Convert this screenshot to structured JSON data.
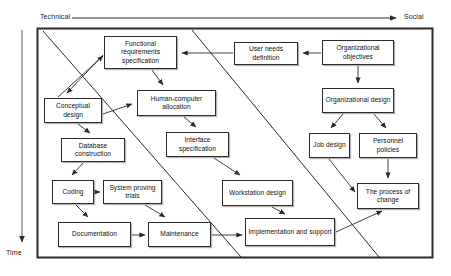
{
  "diagram": {
    "axes": {
      "horizontal": {
        "start_label": "Technical",
        "end_label": "Social",
        "direction": "left-to-right"
      },
      "vertical": {
        "label": "Time",
        "direction": "top-to-bottom"
      }
    },
    "frame": {
      "x": 37,
      "y": 28,
      "width": 396,
      "height": 230
    },
    "colors": {
      "line": "#2b2b2b",
      "box_fill": "#ffffff",
      "text": "#111111",
      "shadow": "#787878",
      "background": "#ffffff"
    },
    "nodes": [
      {
        "id": "functional-requirements-specification",
        "label": "Functional requirements specification",
        "x": 104,
        "y": 36,
        "w": 73,
        "h": 33
      },
      {
        "id": "user-needs-definition",
        "label": "User needs definition",
        "x": 234,
        "y": 42,
        "w": 64,
        "h": 23
      },
      {
        "id": "organizational-objectives",
        "label": "Organizational objectives",
        "x": 322,
        "y": 40,
        "w": 72,
        "h": 25
      },
      {
        "id": "conceptual-design",
        "label": "Conceptual design",
        "x": 44,
        "y": 98,
        "w": 58,
        "h": 25
      },
      {
        "id": "human-computer-allocation",
        "label": "Human-computer allocation",
        "x": 137,
        "y": 90,
        "w": 79,
        "h": 26
      },
      {
        "id": "organizational-design",
        "label": "Organizational design",
        "x": 322,
        "y": 88,
        "w": 72,
        "h": 25
      },
      {
        "id": "database-construction",
        "label": "Database construction",
        "x": 61,
        "y": 138,
        "w": 64,
        "h": 24
      },
      {
        "id": "interface-specification",
        "label": "Interface specification",
        "x": 166,
        "y": 132,
        "w": 63,
        "h": 25
      },
      {
        "id": "job-design",
        "label": "Job design",
        "x": 309,
        "y": 133,
        "w": 41,
        "h": 25
      },
      {
        "id": "personnel-policies",
        "label": "Personnel policies",
        "x": 359,
        "y": 133,
        "w": 58,
        "h": 25
      },
      {
        "id": "coding",
        "label": "Coding",
        "x": 52,
        "y": 180,
        "w": 42,
        "h": 24
      },
      {
        "id": "system-proving-trials",
        "label": "System proving trials",
        "x": 103,
        "y": 180,
        "w": 59,
        "h": 24
      },
      {
        "id": "workstation-design",
        "label": "Workstation design",
        "x": 222,
        "y": 180,
        "w": 71,
        "h": 26
      },
      {
        "id": "the-process-of-change",
        "label": "The process of change",
        "x": 357,
        "y": 183,
        "w": 62,
        "h": 26
      },
      {
        "id": "documentation",
        "label": "Documentation",
        "x": 58,
        "y": 222,
        "w": 73,
        "h": 25
      },
      {
        "id": "maintenance",
        "label": "Maintenance",
        "x": 148,
        "y": 222,
        "w": 63,
        "h": 25
      },
      {
        "id": "implementation-and-support",
        "label": "Implementation and support",
        "x": 245,
        "y": 218,
        "w": 90,
        "h": 28
      }
    ],
    "edges": [
      {
        "from": "organizational-objectives",
        "to": "user-needs-definition"
      },
      {
        "from": "user-needs-definition",
        "to": "functional-requirements-specification"
      },
      {
        "from": "organizational-objectives",
        "to": "organizational-design"
      },
      {
        "from": "organizational-design",
        "to": "job-design"
      },
      {
        "from": "organizational-design",
        "to": "personnel-policies"
      },
      {
        "from": "functional-requirements-specification",
        "to": "conceptual-design"
      },
      {
        "from": "functional-requirements-specification",
        "to": "human-computer-allocation"
      },
      {
        "from": "conceptual-design",
        "to": "functional-requirements-specification"
      },
      {
        "from": "conceptual-design",
        "to": "human-computer-allocation"
      },
      {
        "from": "conceptual-design",
        "to": "database-construction"
      },
      {
        "from": "human-computer-allocation",
        "to": "interface-specification"
      },
      {
        "from": "database-construction",
        "to": "coding"
      },
      {
        "from": "coding",
        "to": "system-proving-trials"
      },
      {
        "from": "coding",
        "to": "documentation"
      },
      {
        "from": "system-proving-trials",
        "to": "maintenance"
      },
      {
        "from": "interface-specification",
        "to": "workstation-design"
      },
      {
        "from": "documentation",
        "to": "maintenance"
      },
      {
        "from": "maintenance",
        "to": "implementation-and-support"
      },
      {
        "from": "workstation-design",
        "to": "implementation-and-support"
      },
      {
        "from": "job-design",
        "to": "the-process-of-change"
      },
      {
        "from": "personnel-policies",
        "to": "the-process-of-change"
      },
      {
        "from": "implementation-and-support",
        "to": "the-process-of-change"
      }
    ],
    "dividers": [
      {
        "id": "divider-left",
        "x1": 43,
        "y1": 31,
        "x2": 241,
        "y2": 257
      },
      {
        "id": "divider-right",
        "x1": 192,
        "y1": 30,
        "x2": 379,
        "y2": 257
      }
    ]
  }
}
